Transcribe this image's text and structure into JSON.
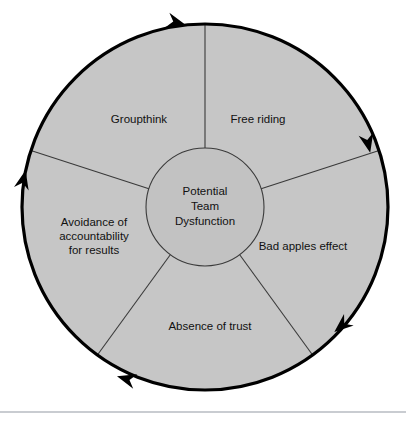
{
  "diagram": {
    "type": "cycle",
    "hub": {
      "name": "potential-team-dysfunction",
      "lines": [
        "Potential",
        "Team",
        "Dysfunction"
      ],
      "full_text": "Potential Team Dysfunction"
    },
    "direction": "clockwise",
    "arrowhead_count": 5,
    "segments": [
      {
        "id": "free-riding",
        "full_text": "Free riding",
        "lines": [
          "Free riding"
        ],
        "label_x": 258,
        "label_y": 120,
        "start_angle": -90,
        "end_angle": -18
      },
      {
        "id": "bad-apples-effect",
        "full_text": "Bad apples effect",
        "lines": [
          "Bad apples effect"
        ],
        "label_x": 303,
        "label_y": 247,
        "start_angle": -18,
        "end_angle": 54
      },
      {
        "id": "absence-of-trust",
        "full_text": "Absence of trust",
        "lines": [
          "Absence of trust"
        ],
        "label_x": 210,
        "label_y": 327,
        "start_angle": 54,
        "end_angle": 126
      },
      {
        "id": "avoidance-of-accountability-for-results",
        "full_text": "Avoidance of accountability for results",
        "lines": [
          "Avoidance of",
          "accountability",
          "for results"
        ],
        "label_x": 94,
        "label_y": 237,
        "start_angle": 126,
        "end_angle": 198
      },
      {
        "id": "groupthink",
        "full_text": "Groupthink",
        "lines": [
          "Groupthink"
        ],
        "label_x": 139,
        "label_y": 120,
        "start_angle": 198,
        "end_angle": 270
      }
    ],
    "geometry": {
      "center_x": 205,
      "center_y": 207,
      "outer_radius": 183,
      "inner_radius": 59
    },
    "colors": {
      "ring_fill": "#c6c6c6",
      "hub_fill": "#c2c2c2",
      "outline": "#000000",
      "spoke": "#3a3a3a",
      "text": "#111111",
      "background": "#ffffff",
      "footer_rule": "#c9ccd1"
    }
  }
}
